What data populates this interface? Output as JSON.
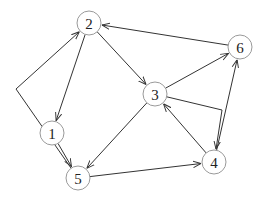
{
  "diagram": {
    "type": "directed-graph",
    "colors": {
      "edge": "#333333",
      "node_stroke": "#9a9a9a",
      "label": "#222222",
      "background": "#ffffff"
    },
    "node_radius": 12,
    "nodes": [
      {
        "id": "1",
        "label": "1",
        "x": 52,
        "y": 133
      },
      {
        "id": "2",
        "label": "2",
        "x": 89,
        "y": 23
      },
      {
        "id": "3",
        "label": "3",
        "x": 155,
        "y": 94
      },
      {
        "id": "4",
        "label": "4",
        "x": 214,
        "y": 162
      },
      {
        "id": "5",
        "label": "5",
        "x": 78,
        "y": 178
      },
      {
        "id": "6",
        "label": "6",
        "x": 240,
        "y": 47
      }
    ],
    "edges": [
      {
        "from": "6",
        "to": "2"
      },
      {
        "from": "2",
        "to": "1"
      },
      {
        "from": "2",
        "to": "3"
      },
      {
        "from": "1",
        "to": "5"
      },
      {
        "from": "3",
        "to": "6"
      },
      {
        "from": "3",
        "to": "4",
        "via": [
          [
            222,
            110
          ]
        ]
      },
      {
        "from": "4",
        "to": "3"
      },
      {
        "from": "3",
        "to": "5"
      },
      {
        "from": "5",
        "to": "4"
      },
      {
        "from": "4",
        "to": "6"
      },
      {
        "from": "5",
        "to": "2",
        "via": [
          [
            16,
            89
          ]
        ]
      }
    ]
  }
}
